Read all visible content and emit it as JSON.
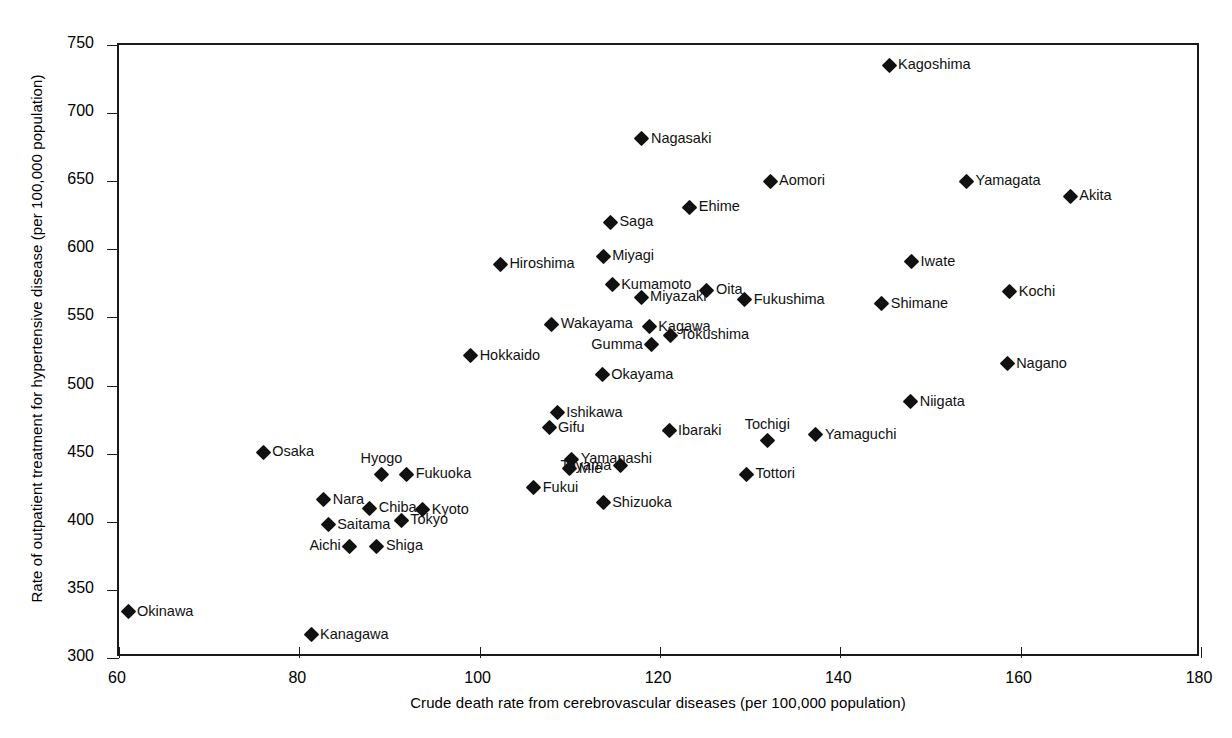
{
  "chart_data": {
    "type": "scatter",
    "title": "",
    "xlabel": "Crude death rate from cerebrovascular diseases (per 100,000 population)",
    "ylabel": "Rate of outpatient treatment for hypertensive disease (per 100,000 population)",
    "xlim": [
      60,
      180
    ],
    "ylim": [
      300,
      750
    ],
    "xticks": [
      60,
      80,
      100,
      120,
      140,
      160,
      180
    ],
    "yticks": [
      300,
      350,
      400,
      450,
      500,
      550,
      600,
      650,
      700,
      750
    ],
    "grid": false,
    "legend": "none",
    "marker": "filled-diamond",
    "marker_color": "#111111",
    "points": [
      {
        "label": "Kagoshima",
        "x": 145.4,
        "y": 735,
        "pos": "right"
      },
      {
        "label": "Nagasaki",
        "x": 118.0,
        "y": 681,
        "pos": "right"
      },
      {
        "label": "Aomori",
        "x": 132.2,
        "y": 650,
        "pos": "right"
      },
      {
        "label": "Yamagata",
        "x": 154.0,
        "y": 650,
        "pos": "right"
      },
      {
        "label": "Akita",
        "x": 165.5,
        "y": 639,
        "pos": "right"
      },
      {
        "label": "Ehime",
        "x": 123.3,
        "y": 631,
        "pos": "right"
      },
      {
        "label": "Saga",
        "x": 114.5,
        "y": 620,
        "pos": "right"
      },
      {
        "label": "Miyagi",
        "x": 113.7,
        "y": 595,
        "pos": "right"
      },
      {
        "label": "Iwate",
        "x": 147.9,
        "y": 591,
        "pos": "right"
      },
      {
        "label": "Hiroshima",
        "x": 102.3,
        "y": 589,
        "pos": "right"
      },
      {
        "label": "Kumamoto",
        "x": 114.7,
        "y": 574,
        "pos": "right"
      },
      {
        "label": "Oita",
        "x": 125.2,
        "y": 570,
        "pos": "right"
      },
      {
        "label": "Kochi",
        "x": 158.8,
        "y": 569,
        "pos": "right"
      },
      {
        "label": "Miyazaki",
        "x": 117.9,
        "y": 565,
        "pos": "right"
      },
      {
        "label": "Fukushima",
        "x": 129.4,
        "y": 563,
        "pos": "right"
      },
      {
        "label": "Shimane",
        "x": 144.6,
        "y": 560,
        "pos": "right"
      },
      {
        "label": "Wakayama",
        "x": 108.0,
        "y": 545,
        "pos": "right"
      },
      {
        "label": "Kagawa",
        "x": 118.8,
        "y": 543,
        "pos": "right"
      },
      {
        "label": "Tokushima",
        "x": 121.2,
        "y": 537,
        "pos": "right"
      },
      {
        "label": "Gumma",
        "x": 119.1,
        "y": 530,
        "pos": "left"
      },
      {
        "label": "Hokkaido",
        "x": 99.0,
        "y": 522,
        "pos": "right"
      },
      {
        "label": "Nagano",
        "x": 158.5,
        "y": 516,
        "pos": "right"
      },
      {
        "label": "Okayama",
        "x": 113.6,
        "y": 508,
        "pos": "right"
      },
      {
        "label": "Niigata",
        "x": 147.8,
        "y": 488,
        "pos": "right"
      },
      {
        "label": "Ishikawa",
        "x": 108.6,
        "y": 480,
        "pos": "right"
      },
      {
        "label": "Gifu",
        "x": 107.7,
        "y": 469,
        "pos": "right"
      },
      {
        "label": "Ibaraki",
        "x": 121.0,
        "y": 467,
        "pos": "right"
      },
      {
        "label": "Yamaguchi",
        "x": 137.3,
        "y": 464,
        "pos": "right"
      },
      {
        "label": "Tochigi",
        "x": 131.9,
        "y": 460,
        "pos": "above"
      },
      {
        "label": "Osaka",
        "x": 76.0,
        "y": 451,
        "pos": "right"
      },
      {
        "label": "Yamanashi",
        "x": 110.2,
        "y": 446,
        "pos": "right"
      },
      {
        "label": "Toyama",
        "x": 115.6,
        "y": 441,
        "pos": "left"
      },
      {
        "label": "Mie",
        "x": 110.0,
        "y": 439,
        "pos": "right"
      },
      {
        "label": "Hyogo",
        "x": 89.1,
        "y": 435,
        "pos": "above"
      },
      {
        "label": "Fukuoka",
        "x": 91.9,
        "y": 435,
        "pos": "right"
      },
      {
        "label": "Tottori",
        "x": 129.6,
        "y": 435,
        "pos": "right"
      },
      {
        "label": "Fukui",
        "x": 106.0,
        "y": 425,
        "pos": "right"
      },
      {
        "label": "Nara",
        "x": 82.7,
        "y": 416,
        "pos": "right"
      },
      {
        "label": "Shizuoka",
        "x": 113.7,
        "y": 414,
        "pos": "right"
      },
      {
        "label": "Chiba",
        "x": 87.8,
        "y": 410,
        "pos": "right"
      },
      {
        "label": "Kyoto",
        "x": 93.7,
        "y": 409,
        "pos": "right"
      },
      {
        "label": "Tokyo",
        "x": 91.3,
        "y": 401,
        "pos": "right"
      },
      {
        "label": "Saitama",
        "x": 83.2,
        "y": 398,
        "pos": "right"
      },
      {
        "label": "Aichi",
        "x": 85.6,
        "y": 382,
        "pos": "left"
      },
      {
        "label": "Shiga",
        "x": 88.6,
        "y": 382,
        "pos": "right"
      },
      {
        "label": "Okinawa",
        "x": 61.0,
        "y": 334,
        "pos": "right"
      },
      {
        "label": "Kanagawa",
        "x": 81.3,
        "y": 317,
        "pos": "right"
      }
    ]
  },
  "axes": {
    "x_title": "Crude death rate from cerebrovascular diseases (per 100,000 population)",
    "y_title": "Rate of outpatient treatment for hypertensive disease (per 100,000 population)",
    "x_tick_labels": [
      "60",
      "80",
      "100",
      "120",
      "140",
      "160",
      "180"
    ],
    "y_tick_labels": [
      "300",
      "350",
      "400",
      "450",
      "500",
      "550",
      "600",
      "650",
      "700",
      "750"
    ]
  }
}
